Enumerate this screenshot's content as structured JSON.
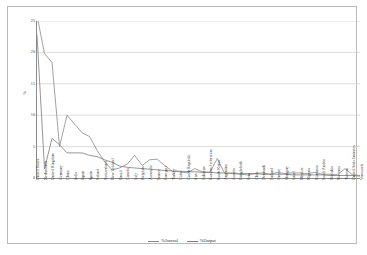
{
  "chart_data": {
    "type": "line",
    "title": "",
    "xlabel": "",
    "ylabel": "%",
    "ylim": [
      0,
      25
    ],
    "yticks": [
      0,
      5,
      10,
      15,
      20,
      25
    ],
    "grid": true,
    "legend_position": "bottom",
    "categories": [
      "United States",
      "Netherlands",
      "United Kingdom",
      "Germany",
      "China",
      "India",
      "Japan",
      "Spain",
      "Poland",
      "Switzerland",
      "New Zealand",
      "Brazil",
      "Canada",
      "Italy",
      "Belgium",
      "Australia",
      "France",
      "Portugal",
      "Turkey",
      "Cuba",
      "Czech Republic",
      "Iran",
      "Pakistan",
      "Russian Federation",
      "South Korea",
      "Argentina",
      "Austria",
      "Bangladesh",
      "Peru",
      "Chile",
      "Denmark",
      "Finland",
      "Greece",
      "Hungary",
      "Israel",
      "Mexico",
      "Nigeria",
      "Romania",
      "Saudi Arabia",
      "Slovakia",
      "Slovenia",
      "Taiwan",
      "United Arab Emirates",
      "Venezuela"
    ],
    "series": [
      {
        "name": "%Journal",
        "color": "#8a8a8a",
        "values": [
          25.9,
          19.8,
          18.4,
          5.0,
          10.0,
          8.6,
          7.2,
          6.6,
          4.4,
          2.6,
          1.3,
          1.6,
          2.2,
          3.6,
          2.0,
          2.9,
          3.0,
          2.0,
          1.1,
          1.0,
          0.8,
          1.5,
          1.0,
          0.9,
          3.1,
          0.7,
          0.7,
          0.6,
          0.5,
          0.7,
          0.8,
          0.6,
          0.9,
          0.7,
          0.8,
          0.8,
          0.7,
          0.9,
          0.6,
          0.6,
          0.5,
          1.5,
          0.5,
          0.4
        ]
      },
      {
        "name": "%Output",
        "color": "#7c7c7c",
        "values": [
          22.8,
          1.5,
          6.3,
          5.3,
          4.0,
          4.0,
          4.0,
          3.6,
          3.4,
          2.9,
          2.5,
          1.9,
          1.7,
          1.6,
          1.5,
          1.4,
          1.3,
          1.2,
          1.1,
          1.1,
          1.0,
          1.0,
          0.9,
          0.9,
          0.8,
          0.8,
          0.8,
          0.7,
          0.7,
          0.7,
          0.6,
          0.6,
          0.6,
          0.6,
          0.5,
          0.5,
          0.5,
          0.5,
          0.5,
          0.4,
          0.4,
          0.4,
          0.4,
          0.3
        ]
      }
    ]
  },
  "legend": {
    "entries": [
      {
        "label": "%Journal"
      },
      {
        "label": "%Output"
      }
    ]
  }
}
